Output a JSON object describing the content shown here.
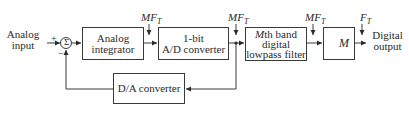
{
  "diagram": {
    "input_label": [
      "Analog",
      "input"
    ],
    "output_label": [
      "Digital",
      "output"
    ],
    "sum": {
      "symbol": "Σ",
      "plus": "+",
      "minus": "−"
    },
    "blocks": {
      "integrator": [
        "Analog",
        "integrator"
      ],
      "adc": [
        "1-bit",
        "A/D converter"
      ],
      "filter": {
        "M": "M",
        "line1_rest": "th band",
        "line2": "digital",
        "line3": "lowpass filter"
      },
      "decimator": {
        "arrow": "↓",
        "M": "M"
      },
      "dac": "D/A converter"
    },
    "rates": {
      "after_integrator": {
        "main": "MF",
        "sub": "T"
      },
      "after_adc": {
        "main": "MF",
        "sub": "T"
      },
      "after_filter": {
        "main": "MF",
        "sub": "T"
      },
      "output": {
        "main": "F",
        "sub": "T"
      }
    },
    "colors": {
      "line": "#3a3a3a",
      "background": "#ffffff"
    }
  }
}
